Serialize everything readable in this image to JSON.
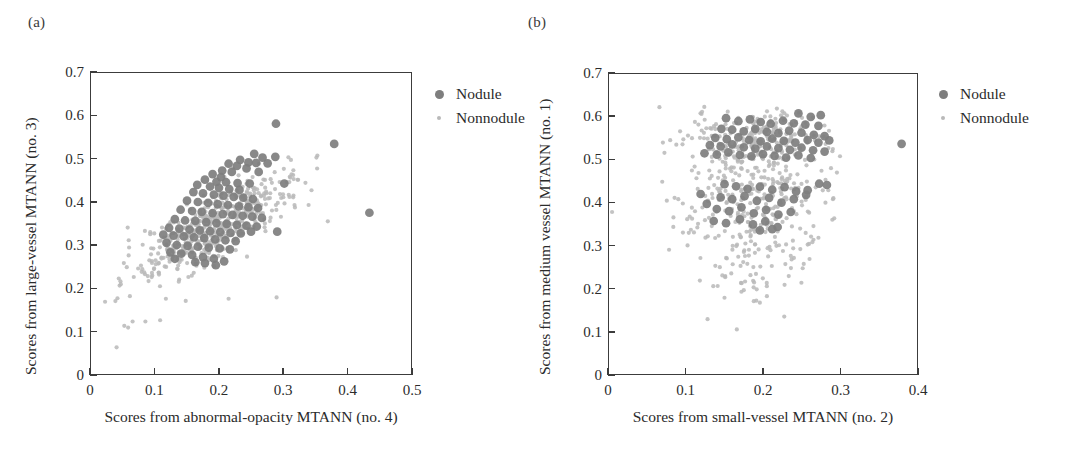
{
  "figure": {
    "background": "#ffffff",
    "nodule_color": "#7e7e7e",
    "nonnodule_color": "#b9b9b9",
    "axis_color": "#3c3c3c"
  },
  "panels": [
    {
      "id": "a",
      "label": "(a)",
      "xlabel": "Scores from abnormal-opacity MTANN (no. 4)",
      "ylabel": "Scores from large-vessel MTANN (no. 3)",
      "xticks": [
        "0",
        "0.1",
        "0.2",
        "0.3",
        "0.4",
        "0.5"
      ],
      "yticks": [
        "0",
        "0.1",
        "0.2",
        "0.3",
        "0.4",
        "0.5",
        "0.6",
        "0.7"
      ],
      "legend": [
        {
          "key": "nodule-marker",
          "label": "Nodule"
        },
        {
          "key": "nonnodule-marker",
          "label": "Nonnodule"
        }
      ]
    },
    {
      "id": "b",
      "label": "(b)",
      "xlabel": "Scores from small-vessel MTANN (no. 2)",
      "ylabel": "Scores from medium vessel MTANN (no. 1)",
      "xticks": [
        "0",
        "0.1",
        "0.2",
        "0.3",
        "0.4"
      ],
      "yticks": [
        "0",
        "0.1",
        "0.2",
        "0.3",
        "0.4",
        "0.5",
        "0.6",
        "0.7"
      ],
      "legend": [
        {
          "key": "nodule-marker",
          "label": "Nodule"
        },
        {
          "key": "nonnodule-marker",
          "label": "Nonnodule"
        }
      ]
    }
  ],
  "chart_data": [
    {
      "type": "scatter",
      "panel": "a",
      "title": "(a)",
      "xlabel": "Scores from abnormal-opacity MTANN (no. 4)",
      "ylabel": "Scores from large-vessel MTANN (no. 3)",
      "xlim": [
        0,
        0.5
      ],
      "ylim": [
        0,
        0.7
      ],
      "xtick_values": [
        0,
        0.1,
        0.2,
        0.3,
        0.4,
        0.5
      ],
      "ytick_values": [
        0,
        0.1,
        0.2,
        0.3,
        0.4,
        0.5,
        0.6,
        0.7
      ],
      "grid": false,
      "legend_position": "outside-right-top",
      "series": [
        {
          "name": "Nodule",
          "color": "#7e7e7e",
          "marker": "circle",
          "marker_size": 9,
          "points": [
            [
              0.289,
              0.582
            ],
            [
              0.38,
              0.535
            ],
            [
              0.435,
              0.375
            ],
            [
              0.255,
              0.512
            ],
            [
              0.268,
              0.503
            ],
            [
              0.288,
              0.505
            ],
            [
              0.233,
              0.498
            ],
            [
              0.246,
              0.492
            ],
            [
              0.258,
              0.491
            ],
            [
              0.276,
              0.49
            ],
            [
              0.215,
              0.489
            ],
            [
              0.228,
              0.484
            ],
            [
              0.205,
              0.473
            ],
            [
              0.22,
              0.47
            ],
            [
              0.243,
              0.478
            ],
            [
              0.262,
              0.47
            ],
            [
              0.19,
              0.465
            ],
            [
              0.203,
              0.458
            ],
            [
              0.178,
              0.452
            ],
            [
              0.196,
              0.447
            ],
            [
              0.211,
              0.446
            ],
            [
              0.229,
              0.444
            ],
            [
              0.248,
              0.443
            ],
            [
              0.302,
              0.443
            ],
            [
              0.166,
              0.44
            ],
            [
              0.186,
              0.436
            ],
            [
              0.2,
              0.433
            ],
            [
              0.216,
              0.43
            ],
            [
              0.232,
              0.428
            ],
            [
              0.16,
              0.423
            ],
            [
              0.175,
              0.42
            ],
            [
              0.192,
              0.417
            ],
            [
              0.207,
              0.415
            ],
            [
              0.223,
              0.412
            ],
            [
              0.238,
              0.41
            ],
            [
              0.253,
              0.407
            ],
            [
              0.15,
              0.403
            ],
            [
              0.167,
              0.4
            ],
            [
              0.183,
              0.398
            ],
            [
              0.198,
              0.395
            ],
            [
              0.214,
              0.393
            ],
            [
              0.231,
              0.39
            ],
            [
              0.246,
              0.388
            ],
            [
              0.261,
              0.386
            ],
            [
              0.14,
              0.382
            ],
            [
              0.158,
              0.379
            ],
            [
              0.173,
              0.377
            ],
            [
              0.19,
              0.374
            ],
            [
              0.206,
              0.372
            ],
            [
              0.221,
              0.37
            ],
            [
              0.237,
              0.368
            ],
            [
              0.252,
              0.366
            ],
            [
              0.267,
              0.363
            ],
            [
              0.131,
              0.36
            ],
            [
              0.147,
              0.357
            ],
            [
              0.163,
              0.356
            ],
            [
              0.18,
              0.353
            ],
            [
              0.196,
              0.351
            ],
            [
              0.212,
              0.349
            ],
            [
              0.228,
              0.347
            ],
            [
              0.243,
              0.345
            ],
            [
              0.259,
              0.343
            ],
            [
              0.122,
              0.34
            ],
            [
              0.138,
              0.338
            ],
            [
              0.154,
              0.336
            ],
            [
              0.17,
              0.334
            ],
            [
              0.186,
              0.332
            ],
            [
              0.202,
              0.33
            ],
            [
              0.218,
              0.328
            ],
            [
              0.234,
              0.327
            ],
            [
              0.25,
              0.331
            ],
            [
              0.291,
              0.331
            ],
            [
              0.113,
              0.324
            ],
            [
              0.129,
              0.322
            ],
            [
              0.145,
              0.32
            ],
            [
              0.161,
              0.318
            ],
            [
              0.177,
              0.316
            ],
            [
              0.194,
              0.313
            ],
            [
              0.21,
              0.311
            ],
            [
              0.226,
              0.309
            ],
            [
              0.118,
              0.305
            ],
            [
              0.134,
              0.3
            ],
            [
              0.151,
              0.298
            ],
            [
              0.167,
              0.296
            ],
            [
              0.184,
              0.294
            ],
            [
              0.201,
              0.292
            ],
            [
              0.217,
              0.29
            ],
            [
              0.124,
              0.283
            ],
            [
              0.141,
              0.28
            ],
            [
              0.158,
              0.277
            ],
            [
              0.175,
              0.272
            ],
            [
              0.192,
              0.268
            ],
            [
              0.208,
              0.262
            ],
            [
              0.163,
              0.26
            ],
            [
              0.178,
              0.258
            ],
            [
              0.195,
              0.253
            ],
            [
              0.131,
              0.268
            ]
          ]
        },
        {
          "name": "Nonnodule",
          "color": "#b9b9b9",
          "marker": "circle",
          "marker_size": 4,
          "cluster_note": "Dense diagonal cloud, roughly x in [0.02,0.40], y in [0.06,0.55], positively correlated.",
          "n_points": 520
        }
      ]
    },
    {
      "type": "scatter",
      "panel": "b",
      "title": "(b)",
      "xlabel": "Scores from small-vessel MTANN (no. 2)",
      "ylabel": "Scores from medium vessel MTANN (no. 1)",
      "xlim": [
        0,
        0.4
      ],
      "ylim": [
        0,
        0.7
      ],
      "xtick_values": [
        0,
        0.1,
        0.2,
        0.3,
        0.4
      ],
      "ytick_values": [
        0,
        0.1,
        0.2,
        0.3,
        0.4,
        0.5,
        0.6,
        0.7
      ],
      "grid": false,
      "legend_position": "outside-right-top",
      "series": [
        {
          "name": "Nodule",
          "color": "#7e7e7e",
          "marker": "circle",
          "marker_size": 9,
          "points": [
            [
              0.38,
              0.537
            ],
            [
              0.246,
              0.608
            ],
            [
              0.262,
              0.6
            ],
            [
              0.275,
              0.604
            ],
            [
              0.152,
              0.597
            ],
            [
              0.168,
              0.59
            ],
            [
              0.183,
              0.594
            ],
            [
              0.197,
              0.588
            ],
            [
              0.21,
              0.584
            ],
            [
              0.226,
              0.591
            ],
            [
              0.24,
              0.585
            ],
            [
              0.255,
              0.582
            ],
            [
              0.272,
              0.579
            ],
            [
              0.146,
              0.572
            ],
            [
              0.16,
              0.57
            ],
            [
              0.175,
              0.566
            ],
            [
              0.19,
              0.572
            ],
            [
              0.205,
              0.565
            ],
            [
              0.22,
              0.562
            ],
            [
              0.234,
              0.568
            ],
            [
              0.25,
              0.563
            ],
            [
              0.266,
              0.558
            ],
            [
              0.28,
              0.555
            ],
            [
              0.138,
              0.551
            ],
            [
              0.153,
              0.548
            ],
            [
              0.168,
              0.552
            ],
            [
              0.182,
              0.546
            ],
            [
              0.197,
              0.543
            ],
            [
              0.212,
              0.549
            ],
            [
              0.227,
              0.544
            ],
            [
              0.242,
              0.54
            ],
            [
              0.258,
              0.546
            ],
            [
              0.272,
              0.54
            ],
            [
              0.286,
              0.545
            ],
            [
              0.131,
              0.534
            ],
            [
              0.145,
              0.531
            ],
            [
              0.16,
              0.536
            ],
            [
              0.175,
              0.529
            ],
            [
              0.19,
              0.526
            ],
            [
              0.205,
              0.531
            ],
            [
              0.22,
              0.527
            ],
            [
              0.235,
              0.523
            ],
            [
              0.25,
              0.528
            ],
            [
              0.265,
              0.522
            ],
            [
              0.28,
              0.519
            ],
            [
              0.124,
              0.515
            ],
            [
              0.14,
              0.512
            ],
            [
              0.155,
              0.517
            ],
            [
              0.17,
              0.511
            ],
            [
              0.185,
              0.508
            ],
            [
              0.2,
              0.513
            ],
            [
              0.215,
              0.509
            ],
            [
              0.23,
              0.505
            ],
            [
              0.246,
              0.51
            ],
            [
              0.262,
              0.504
            ],
            [
              0.15,
              0.443
            ],
            [
              0.165,
              0.438
            ],
            [
              0.18,
              0.432
            ],
            [
              0.196,
              0.437
            ],
            [
              0.212,
              0.43
            ],
            [
              0.228,
              0.436
            ],
            [
              0.243,
              0.426
            ],
            [
              0.258,
              0.429
            ],
            [
              0.273,
              0.444
            ],
            [
              0.283,
              0.441
            ],
            [
              0.145,
              0.412
            ],
            [
              0.16,
              0.408
            ],
            [
              0.176,
              0.415
            ],
            [
              0.192,
              0.404
            ],
            [
              0.208,
              0.411
            ],
            [
              0.224,
              0.4
            ],
            [
              0.24,
              0.408
            ],
            [
              0.256,
              0.418
            ],
            [
              0.14,
              0.385
            ],
            [
              0.156,
              0.38
            ],
            [
              0.172,
              0.389
            ],
            [
              0.188,
              0.375
            ],
            [
              0.204,
              0.383
            ],
            [
              0.22,
              0.372
            ],
            [
              0.236,
              0.378
            ],
            [
              0.136,
              0.357
            ],
            [
              0.152,
              0.352
            ],
            [
              0.17,
              0.361
            ],
            [
              0.187,
              0.349
            ],
            [
              0.203,
              0.356
            ],
            [
              0.219,
              0.343
            ],
            [
              0.196,
              0.335
            ],
            [
              0.212,
              0.338
            ],
            [
              0.119,
              0.42
            ],
            [
              0.127,
              0.397
            ]
          ]
        },
        {
          "name": "Nonnodule",
          "color": "#b9b9b9",
          "marker": "circle",
          "marker_size": 4,
          "cluster_note": "Broad fan-shaped cloud; dense band near y 0.45-0.62 for x 0.07-0.30, tapering down to y ~0.10 near x ~0.19.",
          "n_points": 560
        }
      ]
    }
  ]
}
